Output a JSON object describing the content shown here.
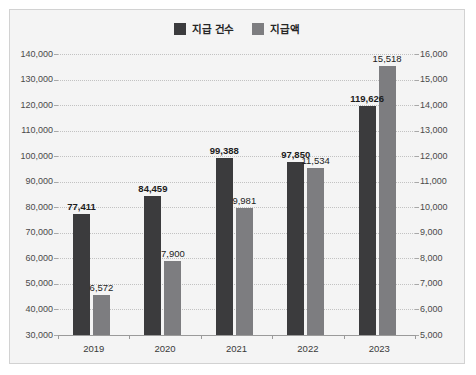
{
  "watermark": "   ",
  "chart_data": {
    "type": "bar",
    "title": "",
    "xlabel": "",
    "categories": [
      "2019",
      "2020",
      "2021",
      "2022",
      "2023"
    ],
    "grid": true,
    "legend_position": "top-center",
    "series": [
      {
        "name": "지급 건수",
        "axis": "left",
        "color": "#3b3b3d",
        "values": [
          77411,
          84459,
          99388,
          97850,
          119626
        ],
        "labels": [
          "77,411",
          "84,459",
          "99,388",
          "97,850",
          "119,626"
        ]
      },
      {
        "name": "지급액",
        "axis": "right",
        "color": "#7d7d80",
        "values": [
          6572,
          7900,
          9981,
          11534,
          15518
        ],
        "labels": [
          "6,572",
          "7,900",
          "9,981",
          "11,534",
          "15,518"
        ]
      }
    ],
    "left_axis": {
      "ylim": [
        30000,
        140000
      ],
      "step": 10000,
      "ticks": [
        "140,000",
        "130,000",
        "120,000",
        "110,000",
        "100,000",
        "90,000",
        "80,000",
        "70,000",
        "60,000",
        "50,000",
        "40,000",
        "30,000"
      ]
    },
    "right_axis": {
      "ylim": [
        5000,
        16000
      ],
      "step": 1000,
      "ticks": [
        "16,000",
        "15,000",
        "14,000",
        "13,000",
        "12,000",
        "11,000",
        "10,000",
        "9,000",
        "8,000",
        "7,000",
        "6,000",
        "5,000"
      ]
    }
  }
}
